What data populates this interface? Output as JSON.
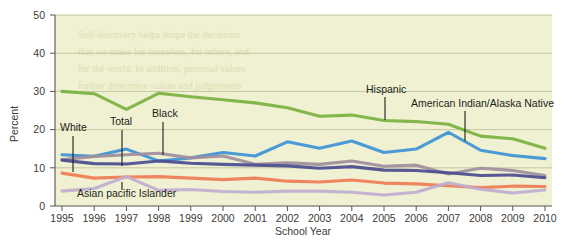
{
  "figure": {
    "name": "status-dropout-rate-line-chart",
    "background_color": "#ffffff",
    "plot_background_color": "#eff1d2"
  },
  "chart_data": {
    "type": "line",
    "title": "",
    "xlabel": "School Year",
    "ylabel": "Percent",
    "x": [
      1995,
      1996,
      1997,
      1998,
      1999,
      2000,
      2001,
      2002,
      2003,
      2004,
      2005,
      2006,
      2007,
      2008,
      2009,
      2010
    ],
    "categories": [
      "1995",
      "1996",
      "1997",
      "1998",
      "1999",
      "2000",
      "2001",
      "2002",
      "2003",
      "2004",
      "2005",
      "2006",
      "2007",
      "2008",
      "2009",
      "2010"
    ],
    "xlim": [
      1995,
      2010
    ],
    "ylim": [
      0,
      50
    ],
    "yticks": [
      0,
      10,
      20,
      30,
      40,
      50
    ],
    "grid": true,
    "legend": "inline-annotations",
    "series": [
      {
        "name": "Hispanic",
        "color": "#7cb342",
        "values": [
          30.0,
          29.4,
          25.3,
          29.5,
          28.6,
          27.8,
          27.0,
          25.7,
          23.5,
          23.8,
          22.4,
          22.1,
          21.4,
          18.3,
          17.6,
          15.1
        ]
      },
      {
        "name": "American Indian/Alaska Native",
        "color": "#3f94d4",
        "values": [
          13.4,
          13.0,
          14.9,
          11.8,
          12.6,
          14.0,
          13.1,
          16.8,
          15.1,
          17.0,
          14.0,
          14.9,
          19.3,
          14.6,
          13.2,
          12.4
        ]
      },
      {
        "name": "Black",
        "color": "#a08f9e",
        "values": [
          12.1,
          13.0,
          13.4,
          13.8,
          12.6,
          13.1,
          10.9,
          11.3,
          10.9,
          11.8,
          10.4,
          10.7,
          8.4,
          9.9,
          9.3,
          8.0
        ]
      },
      {
        "name": "Total",
        "color": "#4c4f8f",
        "values": [
          12.0,
          11.1,
          11.0,
          11.8,
          11.2,
          10.9,
          10.7,
          10.5,
          9.9,
          10.3,
          9.4,
          9.3,
          8.7,
          8.0,
          8.1,
          7.4
        ]
      },
      {
        "name": "White",
        "color": "#ef7d57",
        "values": [
          8.6,
          7.3,
          7.6,
          7.7,
          7.3,
          6.9,
          7.3,
          6.5,
          6.3,
          6.8,
          6.0,
          5.8,
          5.3,
          4.8,
          5.2,
          5.1
        ]
      },
      {
        "name": "Asian pacific Islander",
        "color": "#c0aed0",
        "values": [
          3.9,
          4.6,
          7.7,
          4.1,
          4.3,
          3.8,
          3.6,
          3.9,
          3.9,
          3.6,
          2.9,
          3.6,
          6.1,
          4.4,
          3.4,
          4.2
        ]
      }
    ],
    "annotations": [
      {
        "label": "White",
        "series": "White",
        "anchor_x": 1995.3,
        "text_x": 60,
        "text_y": 131,
        "leader_x": 73,
        "leader_y1": 136,
        "leader_y2": 172
      },
      {
        "label": "Total",
        "series": "Total",
        "anchor_x": 1997.0,
        "text_x": 110,
        "text_y": 125,
        "leader_x": 122,
        "leader_y1": 130,
        "leader_y2": 166
      },
      {
        "label": "Black",
        "series": "Black",
        "anchor_x": 1998.0,
        "text_x": 152,
        "text_y": 117,
        "leader_x": 163,
        "leader_y1": 122,
        "leader_y2": 155
      },
      {
        "label": "Asian pacific Islander",
        "series": "Asian pacific Islander",
        "anchor_x": 1997.0,
        "text_x": 77,
        "text_y": 197,
        "leader_x": 122,
        "leader_y1": 182,
        "leader_y2": 190
      },
      {
        "label": "Hispanic",
        "series": "Hispanic",
        "anchor_x": 2005.0,
        "text_x": 366,
        "text_y": 93,
        "leader_x": 385,
        "leader_y1": 97,
        "leader_y2": 120
      },
      {
        "label": "American Indian/Alaska Native",
        "series": "American Indian/Alaska Native",
        "anchor_x": 2007.5,
        "text_x": 411,
        "text_y": 107,
        "leader_x": 465,
        "leader_y1": 111,
        "leader_y2": 141
      }
    ]
  },
  "bleed_through_lines": [
    "Self-discovery helps shape the decisions",
    "that we make for ourselves, for others, and",
    "for the world. In addition, personal values",
    "further determine values and judgements"
  ]
}
